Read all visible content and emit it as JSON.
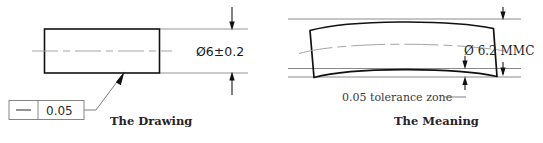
{
  "figure": {
    "panels": [
      {
        "id": "drawing",
        "caption": "The Drawing",
        "dimension_label": "Ø6±0.2",
        "feature_control_frame": {
          "symbol_name": "straightness-symbol",
          "tolerance_value": "0.05"
        }
      },
      {
        "id": "meaning",
        "caption": "The Meaning",
        "dimension_label": "Ø 6.2 MMC",
        "note_label": "0.05 tolerance zone"
      }
    ]
  },
  "colors": {
    "object_line": "#111111",
    "thin_line": "#7d7d7d",
    "extension_line": "#8a8a8a",
    "center_line": "#9a9a9a",
    "text": "#2a2226",
    "background": "#ffffff"
  }
}
